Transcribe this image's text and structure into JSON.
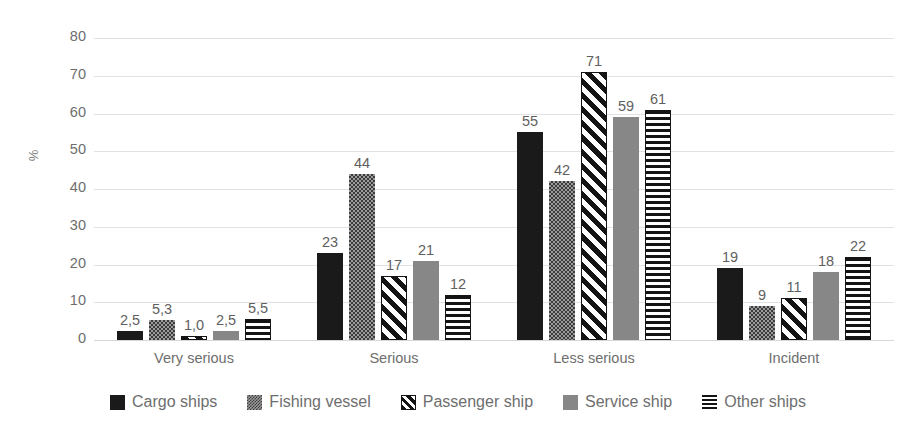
{
  "chart_data": {
    "type": "bar",
    "title": "",
    "xlabel": "",
    "ylabel": "%",
    "ylim": [
      0,
      80
    ],
    "yticks": [
      0,
      10,
      20,
      30,
      40,
      50,
      60,
      70,
      80
    ],
    "grid": true,
    "legend_position": "bottom",
    "categories": [
      "Very serious",
      "Serious",
      "Less serious",
      "Incident"
    ],
    "series": [
      {
        "name": "Cargo ships",
        "pattern": "solid-black",
        "color": "#1a1a1a",
        "values": [
          2.5,
          23,
          55,
          19
        ],
        "labels": [
          "2,5",
          "23",
          "55",
          "19"
        ]
      },
      {
        "name": "Fishing vessel",
        "pattern": "dotted-stipple",
        "color": "#9a9a9a",
        "values": [
          5.3,
          44,
          42,
          9
        ],
        "labels": [
          "5,3",
          "44",
          "42",
          "9"
        ]
      },
      {
        "name": "Passenger ship",
        "pattern": "diagonal-stripes",
        "color": "#141414",
        "values": [
          1.0,
          17,
          71,
          11
        ],
        "labels": [
          "1,0",
          "17",
          "71",
          "11"
        ]
      },
      {
        "name": "Service ship",
        "pattern": "solid-gray",
        "color": "#878787",
        "values": [
          2.5,
          21,
          59,
          18
        ],
        "labels": [
          "2,5",
          "21",
          "59",
          "18"
        ]
      },
      {
        "name": "Other ships",
        "pattern": "horizontal-stripes",
        "color": "#141414",
        "values": [
          5.5,
          12,
          61,
          22
        ],
        "labels": [
          "5,5",
          "12",
          "61",
          "22"
        ]
      }
    ]
  },
  "axis": {
    "y_title": "%",
    "ticks": [
      "80",
      "70",
      "60",
      "50",
      "40",
      "30",
      "20",
      "10",
      "0"
    ]
  },
  "categories_labels": [
    "Very serious",
    "Serious",
    "Less serious",
    "Incident"
  ],
  "legend": {
    "items": [
      {
        "label": "Cargo ships",
        "swatch": "fill-cargo"
      },
      {
        "label": "Fishing vessel",
        "swatch": "fill-fishing"
      },
      {
        "label": "Passenger ship",
        "swatch": "fill-passenger"
      },
      {
        "label": "Service ship",
        "swatch": "fill-service"
      },
      {
        "label": "Other ships",
        "swatch": "fill-other"
      }
    ]
  }
}
